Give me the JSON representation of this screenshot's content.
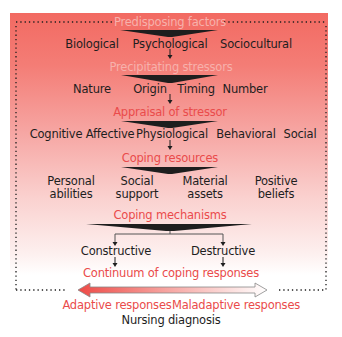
{
  "diagram": {
    "colors": {
      "panel_top": "#f26a62",
      "panel_bottom": "#ffffff",
      "heading_red": "#ea4b4b",
      "heading_on_red": "#f7b1ac",
      "text": "#1e1e1e",
      "dots": "#1e1e1e"
    },
    "stages": [
      {
        "heading": "Predisposing factors",
        "items": [
          "Biological",
          "Psychological",
          "Sociocultural"
        ]
      },
      {
        "heading": "Precipitating stressors",
        "items": [
          "Nature",
          "Origin",
          "Timing",
          "Number"
        ]
      },
      {
        "heading": "Appraisal of stressor",
        "items": [
          "Cognitive",
          "Affective",
          "Physiological",
          "Behavioral",
          "Social"
        ]
      },
      {
        "heading": "Coping resources",
        "items": [
          {
            "line1": "Personal",
            "line2": "abilities"
          },
          {
            "line1": "Social",
            "line2": "support"
          },
          {
            "line1": "Material",
            "line2": "assets"
          },
          {
            "line1": "Positive",
            "line2": "beliefs"
          }
        ]
      },
      {
        "heading": "Coping mechanisms",
        "items": [
          "Constructive",
          "Destructive"
        ]
      }
    ],
    "continuum": {
      "heading": "Continuum of coping responses",
      "left_label": "Adaptive responses",
      "right_label": "Maladaptive responses"
    },
    "footer": "Nursing diagnosis"
  }
}
